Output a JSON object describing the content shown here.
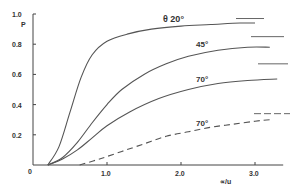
{
  "chart_data": {
    "type": "line",
    "title": "",
    "xlabel": "∝/u",
    "ylabel": "P",
    "xlim": [
      0,
      3.3
    ],
    "ylim": [
      0,
      1.0
    ],
    "x_ticks": [
      "0",
      "1.0",
      "2.0",
      "3.0"
    ],
    "y_ticks": [
      "0",
      "0.2",
      "0.4",
      "0.6",
      "0.8",
      "1.0"
    ],
    "grid": false,
    "legend": "inline curve labels",
    "series": [
      {
        "name": "θ 20°",
        "style": "solid",
        "x": [
          0.2,
          0.35,
          0.5,
          0.65,
          0.8,
          1.0,
          1.3,
          1.6,
          2.0,
          2.4,
          2.8,
          3.0
        ],
        "y": [
          0.0,
          0.12,
          0.35,
          0.58,
          0.73,
          0.82,
          0.87,
          0.9,
          0.92,
          0.93,
          0.94,
          0.94
        ],
        "asymptote": 0.97
      },
      {
        "name": "45°",
        "style": "solid",
        "x": [
          0.2,
          0.4,
          0.6,
          0.8,
          1.0,
          1.2,
          1.5,
          1.8,
          2.1,
          2.5,
          2.9,
          3.2
        ],
        "y": [
          0.0,
          0.05,
          0.15,
          0.28,
          0.4,
          0.5,
          0.6,
          0.67,
          0.72,
          0.76,
          0.78,
          0.78
        ],
        "asymptote": 0.85
      },
      {
        "name": "70°",
        "style": "solid",
        "x": [
          0.2,
          0.4,
          0.6,
          0.8,
          1.0,
          1.3,
          1.7,
          2.1,
          2.5,
          2.9,
          3.3
        ],
        "y": [
          0.0,
          0.04,
          0.1,
          0.18,
          0.26,
          0.35,
          0.44,
          0.5,
          0.54,
          0.56,
          0.57
        ],
        "asymptote": 0.67
      },
      {
        "name": "70°",
        "style": "dashed",
        "x": [
          0.63,
          0.9,
          1.2,
          1.5,
          1.8,
          2.1,
          2.4,
          2.7,
          3.0,
          3.2
        ],
        "y": [
          0.0,
          0.04,
          0.09,
          0.14,
          0.19,
          0.22,
          0.25,
          0.27,
          0.29,
          0.3
        ],
        "asymptote": 0.34
      }
    ]
  },
  "labels": {
    "curve_20": "θ  20°",
    "curve_45": "45°",
    "curve_70": "70°",
    "curve_70_dashed": "70°"
  }
}
